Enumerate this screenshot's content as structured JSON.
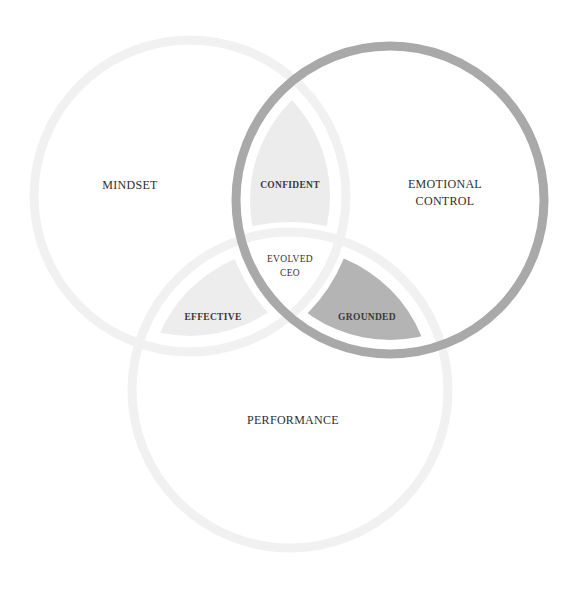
{
  "diagram": {
    "type": "venn",
    "circles": [
      {
        "id": "mindset",
        "label": "MINDSET",
        "cx": 190,
        "cy": 196,
        "r": 156,
        "stroke": "#f1f1f1",
        "stroke_width": 9
      },
      {
        "id": "emotional",
        "label_lines": [
          "EMOTIONAL",
          "CONTROL"
        ],
        "cx": 390,
        "cy": 200,
        "r": 154,
        "stroke": "#a9a9a9",
        "stroke_width": 9
      },
      {
        "id": "performance",
        "label": "PERFORMANCE",
        "cx": 290,
        "cy": 390,
        "r": 158,
        "stroke": "#f1f1f1",
        "stroke_width": 9
      }
    ],
    "regions": {
      "mindset": {
        "label": "MINDSET",
        "x": 130,
        "y": 185
      },
      "emotional": {
        "line1": "EMOTIONAL",
        "line2": "CONTROL",
        "x": 445,
        "y": 193
      },
      "performance": {
        "label": "PERFORMANCE",
        "x": 293,
        "y": 420
      },
      "confident": {
        "label": "CONFIDENT",
        "x": 290,
        "y": 185,
        "fill": "#ececec"
      },
      "effective": {
        "label": "EFFECTIVE",
        "x": 213,
        "y": 317,
        "fill": "#ededed"
      },
      "grounded": {
        "label": "GROUNDED",
        "x": 367,
        "y": 317,
        "fill": "#b4b4b4"
      },
      "center": {
        "line1": "EVOLVED",
        "line2": "CEO",
        "x": 290,
        "y": 266
      }
    }
  }
}
